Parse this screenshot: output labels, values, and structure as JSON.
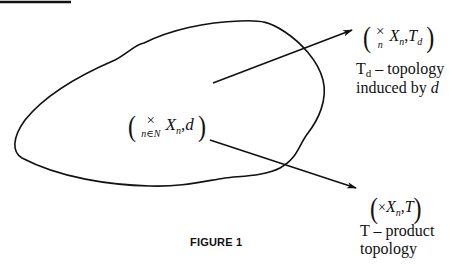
{
  "figure": {
    "caption": "FIGURE 1",
    "colors": {
      "ink": "#111111",
      "background": "#ffffff"
    }
  },
  "center_space": {
    "operator": "×",
    "operator_subscript": "n∈N",
    "set": "X",
    "set_subscript": "n",
    "metric": "d",
    "open_paren": "(",
    "close_paren": ")",
    "comma": ","
  },
  "upper_target": {
    "operator": "×",
    "operator_subscript": "n",
    "set": "X",
    "set_subscript": "n",
    "topology": "T",
    "topology_subscript": "d",
    "open_paren": "(",
    "close_paren": ")",
    "comma": ",",
    "description_line1_prefix": "T",
    "description_line1_sub": "d",
    "description_line1_rest": " – topology",
    "description_line2_text": "induced by ",
    "description_line2_var": "d"
  },
  "lower_target": {
    "operator": "×",
    "set": "X",
    "set_subscript": "n",
    "topology": "T",
    "open_paren": "(",
    "close_paren": ")",
    "comma": ",",
    "description_line1": "T – product",
    "description_line2": "topology"
  }
}
